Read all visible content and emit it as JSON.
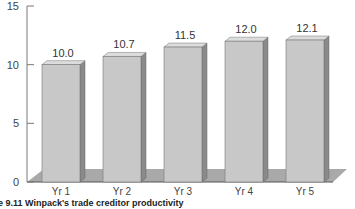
{
  "chart_data": {
    "type": "bar",
    "style": "3d-column",
    "title": "",
    "caption": "e 9.11 Winpack's trade creditor productivity",
    "categories": [
      "Yr 1",
      "Yr 2",
      "Yr 3",
      "Yr 4",
      "Yr 5"
    ],
    "values": [
      10.0,
      10.7,
      11.5,
      12.0,
      12.1
    ],
    "data_labels": [
      "10.0",
      "10.7",
      "11.5",
      "12.0",
      "12.1"
    ],
    "xlabel": "",
    "ylabel": "",
    "ylim": [
      0,
      15
    ],
    "yticks": [
      0,
      5,
      10,
      15
    ],
    "ytick_labels": [
      "0",
      "5",
      "10",
      "15"
    ],
    "grid": false,
    "legend": null,
    "colors": {
      "bar_front": "#c8c8c8",
      "bar_side": "#8a8a8a",
      "bar_top": "#dcdcdc",
      "floor": "#a9a9a9",
      "axis": "#7a7a7a"
    }
  }
}
